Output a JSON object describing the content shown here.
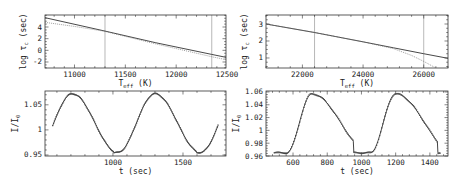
{
  "chart_data": [
    {
      "id": "top-left",
      "type": "line",
      "xlabel": "T_eff (K)",
      "ylabel": "log τ_c (sec)",
      "xlim": [
        10710,
        12490
      ],
      "ylim": [
        -3.03,
        6.06
      ],
      "xticks": [
        11000,
        11500,
        12000,
        12500
      ],
      "xtick_labels": [
        "11000",
        "11500",
        "12000",
        "12500"
      ],
      "yticks": [
        -2,
        0,
        2,
        4
      ],
      "ytick_labels": [
        "-2",
        "0",
        "2",
        "4"
      ],
      "vlines": [
        11300,
        12350
      ],
      "series": [
        {
          "name": "solid",
          "style": "solid",
          "x": [
            10710,
            11300,
            11800,
            12350,
            12490
          ],
          "y": [
            5.6,
            3.3,
            1.3,
            -0.7,
            -1.2
          ]
        },
        {
          "name": "dotted",
          "style": "dotted",
          "x": [
            10710,
            11000,
            11300,
            11800,
            12350,
            12490
          ],
          "y": [
            4.8,
            4.1,
            3.25,
            1.1,
            -1.1,
            -1.6
          ]
        }
      ],
      "frame": {
        "x": 45,
        "y": 15,
        "w": 181,
        "h": 53
      }
    },
    {
      "id": "top-right",
      "type": "line",
      "xlabel": "T_eff (K)",
      "ylabel": "log τ_c (sec)",
      "xlim": [
        20800,
        26800
      ],
      "ylim": [
        0.41,
        3.53
      ],
      "xticks": [
        22000,
        24000,
        26000
      ],
      "xtick_labels": [
        "22000",
        "24000",
        "26000"
      ],
      "yticks": [
        1,
        2,
        3
      ],
      "ytick_labels": [
        "1",
        "2",
        "3"
      ],
      "vlines": [
        22400,
        26000
      ],
      "series": [
        {
          "name": "solid",
          "style": "solid",
          "x": [
            20800,
            22400,
            24000,
            25000,
            26000,
            26800
          ],
          "y": [
            3.0,
            2.5,
            1.95,
            1.6,
            1.25,
            0.98
          ]
        },
        {
          "name": "dotted",
          "style": "dotted",
          "x": [
            20800,
            22400,
            24000,
            25000,
            25600,
            26000,
            26400
          ],
          "y": [
            3.0,
            2.5,
            1.95,
            1.55,
            1.15,
            0.8,
            0.41
          ]
        }
      ],
      "frame": {
        "x": 266,
        "y": 15,
        "w": 182,
        "h": 53
      }
    },
    {
      "id": "bottom-left",
      "type": "scatter",
      "xlabel": "t (sec)",
      "ylabel": "I/I_0",
      "xlim": [
        515,
        1807
      ],
      "ylim": [
        0.948,
        1.0775
      ],
      "xticks": [
        1000,
        1500
      ],
      "xtick_labels": [
        "1000",
        "1500"
      ],
      "yticks": [
        0.95,
        1.0,
        1.05
      ],
      "ytick_labels": [
        "0.95",
        "1",
        "1.05"
      ],
      "model": {
        "t_start": 570,
        "t_end": 1750,
        "period": 590,
        "peak_t": 710,
        "max": 1.072,
        "min": 0.955,
        "peak_width": 0.45
      },
      "frame": {
        "x": 45,
        "y": 91,
        "w": 181,
        "h": 65
      }
    },
    {
      "id": "bottom-right",
      "type": "scatter",
      "xlabel": "t (sec)",
      "ylabel": "I/I_0",
      "xlim": [
        442,
        1506
      ],
      "ylim": [
        0.96,
        1.0615
      ],
      "xticks": [
        600,
        800,
        1000,
        1200,
        1400
      ],
      "xtick_labels": [
        "600",
        "800",
        "1000",
        "1200",
        "1400"
      ],
      "yticks": [
        0.96,
        0.98,
        1.0,
        1.02,
        1.04,
        1.06
      ],
      "ytick_labels": [
        "0.96",
        "0.98",
        "1",
        "1.02",
        "1.04",
        "1.06"
      ],
      "model": {
        "t_start": 490,
        "t_end": 1460,
        "period": 490,
        "peak_t": 710,
        "max": 1.057,
        "min": 0.965,
        "peak_width": 0.3
      },
      "frame": {
        "x": 266,
        "y": 91,
        "w": 182,
        "h": 65
      }
    }
  ]
}
